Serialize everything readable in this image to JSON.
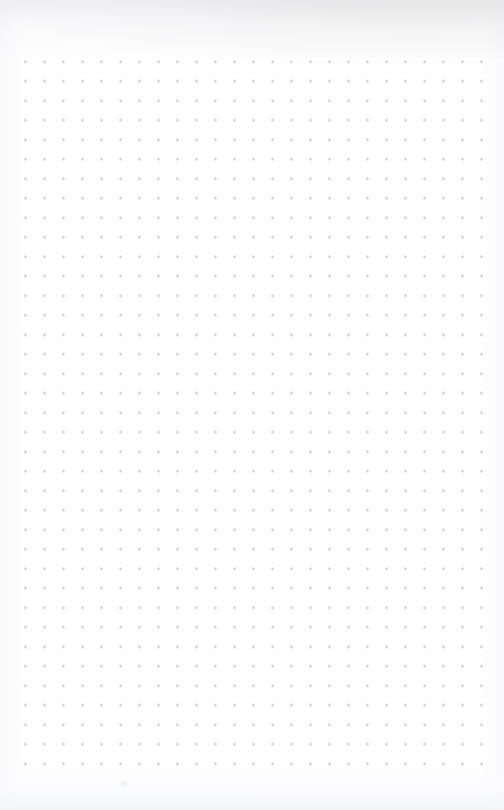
{
  "page": {
    "kind": "dot-grid-notebook-page",
    "width": 504,
    "height": 810,
    "background_color": "#fefeff",
    "has_text": false,
    "has_handwriting": false,
    "visible_text": ""
  },
  "grid": {
    "type": "dot-grid",
    "dot_color": "#b2b2ba",
    "dot_diameter_px": 1.6,
    "spacing_x_px": 19,
    "spacing_y_px": 19.5,
    "origin_x_px": 25,
    "origin_y_px": 62,
    "columns": 25,
    "rows": 37,
    "left_margin_px": 25,
    "right_last_dot_px": 481,
    "top_first_dot_px": 62,
    "bottom_last_dot_px": 763
  },
  "artifacts": {
    "top_edge_shadow_color": "#cecdcb",
    "bottom_edge_shadow_color": "#f2f3f6",
    "smudge": {
      "x": 120,
      "y": 781,
      "width": 9,
      "height": 7,
      "color": "#c4c4ca"
    }
  }
}
